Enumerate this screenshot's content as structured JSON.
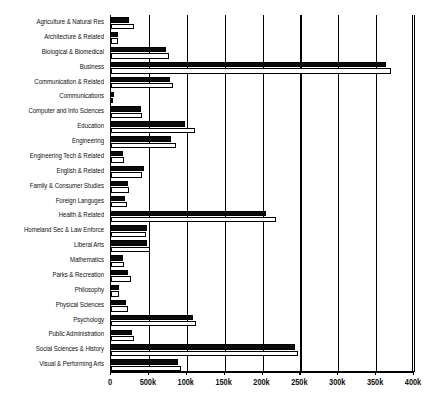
{
  "chart_data": {
    "type": "bar",
    "orientation": "horizontal",
    "title": "",
    "subtitle": "",
    "xlabel": "",
    "ylabel": "",
    "xlim": [
      0,
      400000
    ],
    "grid": true,
    "legend_position": "none",
    "xticks": [
      0,
      50000,
      100000,
      150000,
      200000,
      250000,
      300000,
      350000,
      400000
    ],
    "xtick_labels": [
      "0",
      "500k",
      "100k",
      "150k",
      "200k",
      "250k",
      "300k",
      "350k",
      "400k"
    ],
    "categories": [
      "Agriculture & Natural Res",
      "Architecture & Related",
      "Biological & Biomedical",
      "Business",
      "Communication & Related",
      "Communications",
      "Computer and Info Sciences",
      "Education",
      "Engineering",
      "Engineering Tech & Related",
      "English & Related",
      "Family & Consumer Studies",
      "Foreign Languges",
      "Health & Related",
      "Homeland Sec & Law Enforce",
      "Liberal Arts",
      "Mathematics",
      "Parks & Recreation",
      "Philosophy",
      "Physical Sciences",
      "Psychology",
      "Public Administration",
      "Social Sciences & History",
      "Visual & Performing Arts"
    ],
    "series": [
      {
        "name": "black-bar",
        "color": "#0b0b0b",
        "values": [
          24000,
          9500,
          73000,
          363000,
          78000,
          4000,
          39000,
          98000,
          79000,
          16000,
          44000,
          22000,
          19000,
          205000,
          48000,
          47000,
          16000,
          22000,
          11000,
          20000,
          108000,
          28000,
          243000,
          89000
        ]
      },
      {
        "name": "white-bar",
        "color": "#ffffff",
        "values": [
          30000,
          9000,
          77000,
          370000,
          82000,
          2000,
          41000,
          111000,
          86000,
          17000,
          41000,
          24000,
          21000,
          218000,
          46000,
          52000,
          17000,
          26000,
          10000,
          23000,
          112000,
          30000,
          247000,
          93000
        ]
      }
    ]
  }
}
